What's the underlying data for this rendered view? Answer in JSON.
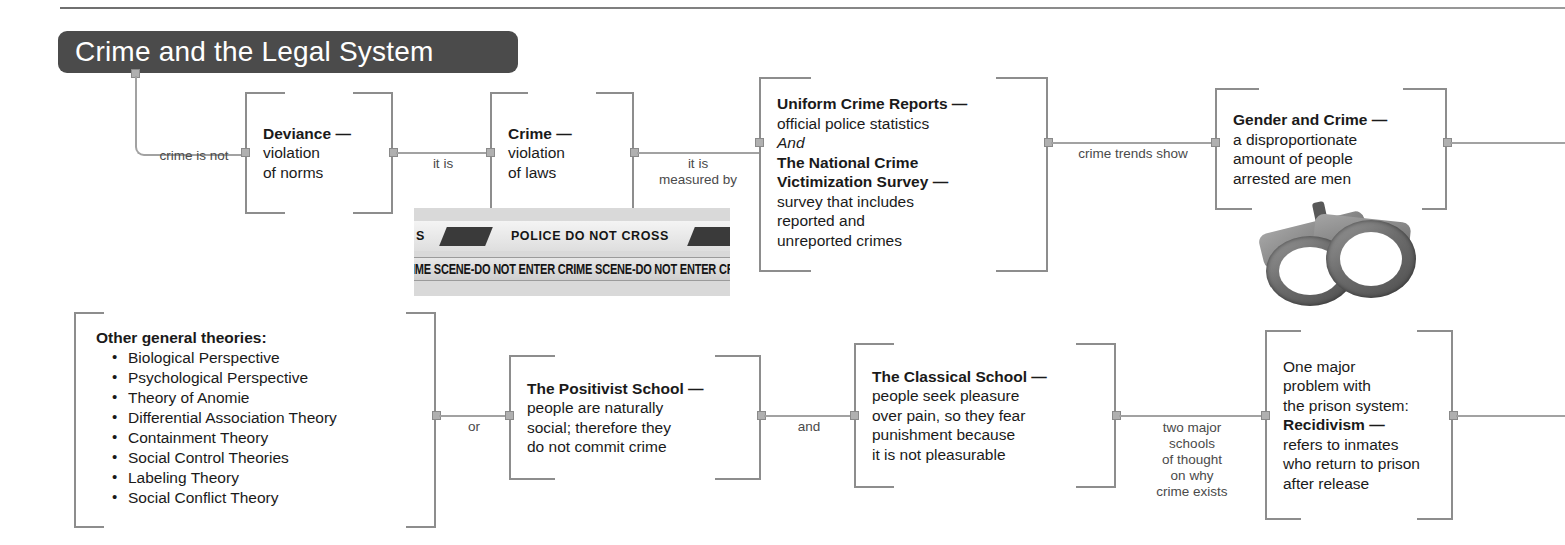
{
  "title": "Crime and the Legal System",
  "boxes": {
    "deviance": {
      "lines": [
        {
          "text": "Deviance —",
          "bold": true
        },
        {
          "text": "violation",
          "bold": false
        },
        {
          "text": "of norms",
          "bold": false
        }
      ]
    },
    "crime": {
      "lines": [
        {
          "text": "Crime —",
          "bold": true
        },
        {
          "text": "violation",
          "bold": false
        },
        {
          "text": "of laws",
          "bold": false
        }
      ]
    },
    "ucr_ncvs": {
      "lines": [
        {
          "text": "Uniform Crime Reports —",
          "bold": true
        },
        {
          "text": "official police statistics",
          "bold": false
        },
        {
          "text": "And",
          "bold": false,
          "italic": true
        },
        {
          "text": "The National Crime",
          "bold": true
        },
        {
          "text": "Victimization Survey —",
          "bold": true
        },
        {
          "text": "survey that includes",
          "bold": false
        },
        {
          "text": "reported and",
          "bold": false
        },
        {
          "text": "unreported crimes",
          "bold": false
        }
      ]
    },
    "gender_crime": {
      "lines": [
        {
          "text": "Gender and Crime —",
          "bold": true
        },
        {
          "text": "a disproportionate",
          "bold": false
        },
        {
          "text": "amount of people",
          "bold": false
        },
        {
          "text": "arrested are men",
          "bold": false
        }
      ]
    },
    "other_theories": {
      "heading": "Other general theories:",
      "items": [
        "Biological Perspective",
        "Psychological Perspective",
        "Theory of Anomie",
        "Differential Association Theory",
        "Containment Theory",
        "Social Control Theories",
        "Labeling Theory",
        "Social Conflict Theory"
      ]
    },
    "positivist": {
      "lines": [
        {
          "text": "The Positivist School —",
          "bold": true
        },
        {
          "text": "people are naturally",
          "bold": false
        },
        {
          "text": "social; therefore they",
          "bold": false
        },
        {
          "text": "do not commit crime",
          "bold": false
        }
      ]
    },
    "classical": {
      "lines": [
        {
          "text": "The Classical School —",
          "bold": true
        },
        {
          "text": "people seek pleasure",
          "bold": false
        },
        {
          "text": "over pain, so they fear",
          "bold": false
        },
        {
          "text": "punishment because",
          "bold": false
        },
        {
          "text": "it is not pleasurable",
          "bold": false
        }
      ]
    },
    "recidivism": {
      "lines": [
        {
          "text": "One major",
          "bold": false
        },
        {
          "text": "problem with",
          "bold": false
        },
        {
          "text": "the prison system:",
          "bold": false
        },
        {
          "text": "Recidivism —",
          "bold": true
        },
        {
          "text": "refers to inmates",
          "bold": false
        },
        {
          "text": "who return to prison",
          "bold": false
        },
        {
          "text": "after release",
          "bold": false
        }
      ]
    }
  },
  "connectors": {
    "crime_is_not": "crime is not",
    "it_is": "it is",
    "it_is_measured_by_l1": "it is",
    "it_is_measured_by_l2": "measured by",
    "crime_trends_show": "crime trends show",
    "or": "or",
    "and": "and",
    "two_major_l1": "two major",
    "two_major_l2": "schools",
    "two_major_l3": "of thought",
    "two_major_l4": "on why",
    "two_major_l5": "crime exists"
  },
  "photos": {
    "crime_scene_tape": {
      "upper_text_1": "POLICE DO NOT CROSS",
      "upper_text_2": "P",
      "upper_text_0": "S",
      "lower_text": "IME SCENE-DO NOT ENTER  CRIME SCENE-DO NOT ENTER  CRIME SCEN"
    },
    "handcuffs": {
      "caption": ""
    }
  },
  "colors": {
    "title_bar": "#4b4b4b",
    "title_text": "#ffffff",
    "box_border": "#8d8d8d",
    "connector": "#a2a2a2",
    "node": "#b0b0b0",
    "text": "#1a1a1a",
    "label_text": "#4a4a4a",
    "background": "#ffffff"
  }
}
